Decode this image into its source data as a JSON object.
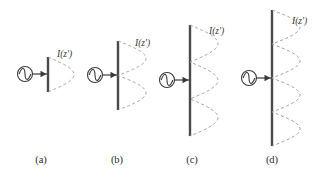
{
  "figure": {
    "width": 331,
    "height": 179,
    "background": "#ffffff",
    "line_color": "#4a4a4a",
    "dash_color": "#9a9a9a",
    "source_color": "#3a3a3a",
    "text_color": "#2b2b2b"
  },
  "panels": [
    {
      "id": "a",
      "caption": "(a)",
      "caption_x": 41,
      "caption_y": 154,
      "curve_label": "I(z')",
      "label_x": 57,
      "label_y": 49,
      "wire_x": 48,
      "wire_top": 57,
      "wire_bottom": 92,
      "feed_y": 74,
      "source_cx": 25,
      "source_cy": 74,
      "source_r": 7.5,
      "lobes": 1,
      "lobe_peak": 26,
      "description": "half-wave dipole, single current lobe"
    },
    {
      "id": "b",
      "caption": "(b)",
      "caption_x": 117,
      "caption_y": 154,
      "curve_label": "I(z')",
      "label_x": 135,
      "label_y": 38,
      "wire_x": 118,
      "wire_top": 41,
      "wire_bottom": 110,
      "feed_y": 75,
      "source_cx": 95,
      "source_cy": 75,
      "source_r": 7.5,
      "lobes": 2,
      "lobe_peak": 28,
      "description": "full-wave dipole, two current lobes"
    },
    {
      "id": "c",
      "caption": "(c)",
      "caption_x": 192,
      "caption_y": 154,
      "curve_label": "I(z')",
      "label_x": 209,
      "label_y": 26,
      "wire_x": 190,
      "wire_top": 25,
      "wire_bottom": 136,
      "feed_y": 80,
      "source_cx": 167,
      "source_cy": 80,
      "source_r": 7.5,
      "lobes": 3,
      "lobe_peak": 28,
      "description": "three-halves-wave dipole, three current lobes"
    },
    {
      "id": "d",
      "caption": "(d)",
      "caption_x": 272,
      "caption_y": 154,
      "curve_label": "I(z')",
      "label_x": 292,
      "label_y": 16,
      "wire_x": 272,
      "wire_top": 10,
      "wire_bottom": 146,
      "feed_y": 78,
      "source_cx": 249,
      "source_cy": 78,
      "source_r": 7.5,
      "lobes": 4,
      "lobe_peak": 28,
      "description": "two-wave dipole, four current lobes"
    }
  ]
}
